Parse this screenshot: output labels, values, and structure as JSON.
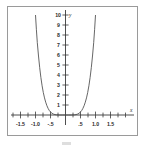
{
  "chart_data": {
    "type": "line",
    "title": "",
    "subtitle": "",
    "xlabel": "x",
    "ylabel": "y",
    "xlim": [
      -1.75,
      1.75
    ],
    "ylim": [
      -0.9,
      10.4
    ],
    "grid": false,
    "legend": null,
    "x_tick_labels": [
      "-1.5",
      "-1.0",
      "-.5",
      ".5",
      "1.0",
      "1.5"
    ],
    "x_tick_values": [
      -1.5,
      -1.0,
      -0.5,
      0.5,
      1.0,
      1.5
    ],
    "x_minor_tick_values": [
      -1.75,
      -1.25,
      -0.75,
      -0.25,
      0.25,
      0.75,
      1.25,
      1.75
    ],
    "y_tick_labels": [
      "1",
      "2",
      "3",
      "4",
      "5",
      "6",
      "7",
      "8",
      "9",
      "10"
    ],
    "y_tick_values": [
      1,
      2,
      3,
      4,
      5,
      6,
      7,
      8,
      9,
      10
    ],
    "series": [
      {
        "name": "curve",
        "x": [
          -1.05,
          -1.02,
          -1.0,
          -0.97,
          -0.94,
          -0.9,
          -0.86,
          -0.82,
          -0.78,
          -0.74,
          -0.7,
          -0.66,
          -0.62,
          -0.58,
          -0.54,
          -0.5,
          -0.45,
          -0.4,
          -0.35,
          -0.3,
          -0.25,
          -0.2,
          -0.15,
          -0.1,
          -0.05,
          0.0,
          0.05,
          0.1,
          0.15,
          0.2,
          0.25,
          0.3,
          0.35,
          0.4,
          0.45,
          0.5,
          0.54,
          0.58,
          0.62,
          0.66,
          0.7,
          0.74,
          0.78,
          0.82,
          0.86,
          0.9,
          0.94,
          0.97,
          1.0,
          1.02,
          1.05
        ],
        "y": [
          12.76,
          11.04,
          10.0,
          8.53,
          7.24,
          5.9,
          4.73,
          3.74,
          2.92,
          2.25,
          1.71,
          1.28,
          0.93,
          0.66,
          0.45,
          0.31,
          0.17,
          0.09,
          0.04,
          0.02,
          0.01,
          0.0,
          0.0,
          0.0,
          0.0,
          0.0,
          0.0,
          0.0,
          0.0,
          0.0,
          0.01,
          0.02,
          0.04,
          0.09,
          0.17,
          0.31,
          0.45,
          0.66,
          0.93,
          1.28,
          1.71,
          2.25,
          2.92,
          3.74,
          4.73,
          5.9,
          7.24,
          8.53,
          10.0,
          11.04,
          12.76
        ]
      }
    ]
  }
}
